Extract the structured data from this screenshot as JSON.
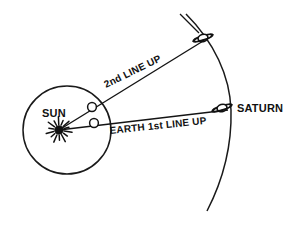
{
  "diagram": {
    "background_color": "#ffffff",
    "ink_color": "#141414",
    "labels": {
      "sun": "SUN",
      "saturn": "SATURN",
      "first_line_up": "EARTH 1st LINE UP",
      "second_line_up": "2nd LINE UP"
    },
    "bodies": {
      "sun": {
        "name": "Sun",
        "icon": "sun-starburst-icon",
        "x": 59,
        "y": 130,
        "core_radius": 4.2,
        "ray_count": 14,
        "ray_length": 9
      },
      "earth_first": {
        "name": "Earth at first line up",
        "icon": "earth-marker-icon",
        "x": 94,
        "y": 123,
        "radius": 4.4
      },
      "earth_second": {
        "name": "Earth at second line up",
        "icon": "earth-marker-icon",
        "x": 92,
        "y": 107,
        "radius": 4.4
      },
      "saturn_first": {
        "name": "Saturn at first line up",
        "icon": "saturn-ringed-planet-icon",
        "x": 222,
        "y": 108,
        "body_rx": 5.0,
        "body_ry": 3.6,
        "ring_rx": 10.5,
        "ring_ry": 2.6,
        "ring_tilt_deg": -18
      },
      "saturn_second": {
        "name": "Saturn at second line up",
        "icon": "saturn-ringed-planet-icon",
        "x": 203,
        "y": 38,
        "body_rx": 5.0,
        "body_ry": 3.6,
        "ring_rx": 10.5,
        "ring_ry": 2.6,
        "ring_tilt_deg": -18
      }
    },
    "paths": {
      "earth_orbit_circle": {
        "name": "Earth orbit",
        "cx": 67,
        "cy": 130,
        "r": 44
      },
      "saturn_orbit_arc": {
        "name": "Saturn orbit arc",
        "d": "M 186 14 C 214 42, 230 76, 231 110 C 232 148, 222 182, 207 211"
      },
      "sight_line_first": {
        "name": "First line up sight line",
        "from_x": 59,
        "from_y": 130,
        "to_x": 228,
        "to_y": 110
      },
      "sight_line_second": {
        "name": "Second line up sight line",
        "from_x": 59,
        "from_y": 130,
        "to_x": 208,
        "to_y": 38
      },
      "extension_line_second": {
        "name": "Second line up extension beyond Saturn",
        "from_x": 199,
        "from_y": 33,
        "to_x": 180,
        "to_y": 14
      }
    },
    "label_positions": {
      "sun": {
        "x": 42,
        "y": 117
      },
      "saturn": {
        "x": 237,
        "y": 112
      },
      "first_line_up": {
        "x": 110,
        "y": 134,
        "rotation_deg": -6
      },
      "second_line_up": {
        "x": 106,
        "y": 88,
        "rotation_deg": -26
      }
    }
  }
}
